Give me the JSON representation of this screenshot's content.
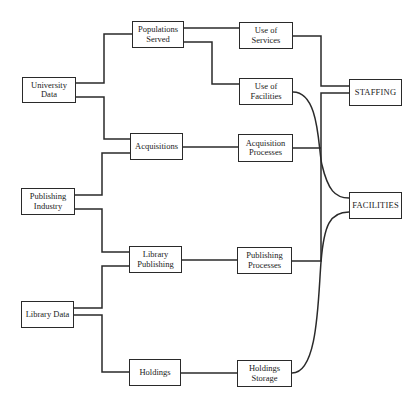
{
  "diagram": {
    "type": "flow-diagram",
    "sources": {
      "university_data": "University Data",
      "publishing_industry": "Publishing\nIndustry",
      "library_data": "Library Data"
    },
    "intermediate": {
      "populations_served": "Populations\nServed",
      "acquisitions": "Acquisitions",
      "library_publishing": "Library\nPublishing",
      "holdings": "Holdings"
    },
    "processes": {
      "use_of_services": "Use of Services",
      "use_of_facilities": "Use of Facilities",
      "acquisition_processes": "Acquisition\nProcesses",
      "publishing_processes": "Publishing\nProcesses",
      "holdings_storage": "Holdings\nStorage"
    },
    "outputs": {
      "staffing": "STAFFING",
      "facilities": "FACILITIES"
    },
    "edges": [
      [
        "University Data",
        "Populations Served"
      ],
      [
        "University Data",
        "Acquisitions"
      ],
      [
        "Publishing Industry",
        "Acquisitions"
      ],
      [
        "Publishing Industry",
        "Library Publishing"
      ],
      [
        "Library Data",
        "Library Publishing"
      ],
      [
        "Library Data",
        "Holdings"
      ],
      [
        "Populations Served",
        "Use of Services"
      ],
      [
        "Populations Served",
        "Use of Facilities"
      ],
      [
        "Acquisitions",
        "Acquisition Processes"
      ],
      [
        "Library Publishing",
        "Publishing Processes"
      ],
      [
        "Holdings",
        "Holdings Storage"
      ],
      [
        "Use of Services",
        "STAFFING"
      ],
      [
        "Acquisition Processes",
        "STAFFING"
      ],
      [
        "Publishing Processes",
        "STAFFING"
      ],
      [
        "Use of Facilities",
        "FACILITIES"
      ],
      [
        "Holdings Storage",
        "FACILITIES"
      ]
    ]
  }
}
